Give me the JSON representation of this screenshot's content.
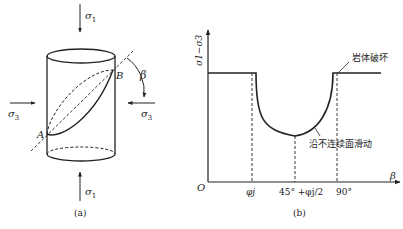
{
  "figure_a": {
    "caption": "(a)",
    "labels": {
      "sigma1_top": "σ",
      "sigma1_top_sub": "1",
      "sigma1_bottom": "σ",
      "sigma1_bottom_sub": "1",
      "sigma3_left": "σ",
      "sigma3_left_sub": "3",
      "sigma3_right": "σ",
      "sigma3_right_sub": "3",
      "point_a": "A",
      "point_b": "B",
      "angle": "β"
    }
  },
  "figure_b": {
    "caption": "(b)",
    "y_axis_label": "σ1−σ3",
    "x_axis_label": "β",
    "origin": "O",
    "x_ticks": [
      "φj",
      "45° +φj/2",
      "90°"
    ],
    "annotation_rock_failure": "岩体破坏",
    "annotation_slip": "沿不连续面滑动"
  },
  "colors": {
    "line": "#222222",
    "background": "#ffffff"
  }
}
